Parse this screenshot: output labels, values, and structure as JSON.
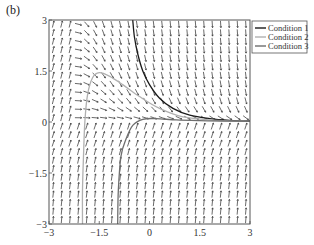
{
  "panel_label": "(b)",
  "chart_data": {
    "type": "line",
    "subtype": "direction-field-with-trajectories",
    "title": "",
    "xlabel": "",
    "ylabel": "",
    "xlim": [
      -3,
      3
    ],
    "ylim": [
      -3,
      3
    ],
    "x_ticks": [
      -3,
      -1.5,
      0,
      1.5,
      3
    ],
    "x_tick_labels": [
      "-3",
      "-1.5",
      "0",
      "1.5",
      "3"
    ],
    "y_ticks": [
      -3,
      -1.5,
      0,
      1.5,
      3
    ],
    "y_tick_labels": [
      "-3",
      "-1.5",
      "0",
      "1.5",
      "3"
    ],
    "grid": false,
    "legend_position": "outside-upper-right",
    "direction_field": {
      "grid_columns": 24,
      "grid_rows": 24,
      "description": "arrows point upward in lower half and top-left region, downward in upper-right region, converging to y≈0 on the right"
    },
    "series": [
      {
        "name": "Condition 1",
        "color": "#1a1a1a",
        "points": [
          [
            -0.5,
            3
          ],
          [
            -0.45,
            2.5
          ],
          [
            -0.35,
            2.0
          ],
          [
            -0.2,
            1.5
          ],
          [
            0.0,
            1.1
          ],
          [
            0.3,
            0.7
          ],
          [
            0.7,
            0.4
          ],
          [
            1.2,
            0.2
          ],
          [
            1.8,
            0.1
          ],
          [
            2.4,
            0.05
          ],
          [
            3.0,
            0.03
          ]
        ]
      },
      {
        "name": "Condition 2",
        "color": "#b0b0b0",
        "points": [
          [
            -2.0,
            -3
          ],
          [
            -2.0,
            -2.0
          ],
          [
            -1.97,
            -1.0
          ],
          [
            -1.93,
            0.0
          ],
          [
            -1.85,
            0.8
          ],
          [
            -1.7,
            1.3
          ],
          [
            -1.5,
            1.45
          ],
          [
            -1.2,
            1.35
          ],
          [
            -0.8,
            1.1
          ],
          [
            -0.3,
            0.75
          ],
          [
            0.3,
            0.4
          ],
          [
            1.0,
            0.15
          ],
          [
            2.0,
            0.05
          ],
          [
            3.0,
            0.02
          ]
        ]
      },
      {
        "name": "Condition 3",
        "color": "#6e6e6e",
        "points": [
          [
            -0.95,
            -3
          ],
          [
            -0.93,
            -2.0
          ],
          [
            -0.85,
            -1.0
          ],
          [
            -0.7,
            -0.5
          ],
          [
            -0.5,
            -0.1
          ],
          [
            -0.2,
            0.08
          ],
          [
            0.2,
            0.1
          ],
          [
            0.8,
            0.06
          ],
          [
            1.5,
            0.04
          ],
          [
            2.2,
            0.03
          ],
          [
            3.0,
            0.02
          ]
        ]
      }
    ]
  },
  "legend": {
    "items": [
      {
        "label": "Condition 1",
        "color": "#1a1a1a"
      },
      {
        "label": "Condition 2",
        "color": "#b0b0b0"
      },
      {
        "label": "Condition 3",
        "color": "#6e6e6e"
      }
    ]
  }
}
